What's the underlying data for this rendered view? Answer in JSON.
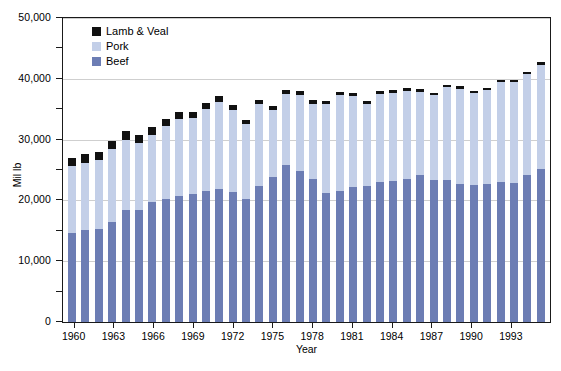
{
  "chart_data": {
    "type": "bar",
    "subtype": "stacked-bar",
    "title": "",
    "xlabel": "Year",
    "ylabel": "Mil lb",
    "ylim": [
      0,
      50000
    ],
    "ytick_labels": [
      "0",
      "10,000",
      "20,000",
      "30,000",
      "40,000",
      "50,000"
    ],
    "ytick_values": [
      0,
      10000,
      20000,
      30000,
      40000,
      50000
    ],
    "yminor_tick_values": [
      5000,
      15000,
      25000,
      35000,
      45000
    ],
    "grid": "horizontal-major",
    "legend_position": "top-left-inside",
    "categories": [
      "1960",
      "1961",
      "1962",
      "1963",
      "1964",
      "1965",
      "1966",
      "1967",
      "1968",
      "1969",
      "1970",
      "1971",
      "1972",
      "1973",
      "1974",
      "1975",
      "1976",
      "1977",
      "1978",
      "1979",
      "1980",
      "1981",
      "1982",
      "1983",
      "1984",
      "1985",
      "1986",
      "1987",
      "1988",
      "1989",
      "1990",
      "1991",
      "1992",
      "1993",
      "1994",
      "1995"
    ],
    "xtick_labels": [
      "1960",
      "1963",
      "1966",
      "1969",
      "1972",
      "1975",
      "1978",
      "1981",
      "1984",
      "1987",
      "1990",
      "1993"
    ],
    "series": [
      {
        "name": "Beef",
        "color": "#6c7db4",
        "values": [
          14700,
          15100,
          15300,
          16500,
          18400,
          18500,
          19700,
          20200,
          20800,
          21000,
          21600,
          21800,
          21400,
          20200,
          22400,
          23900,
          25800,
          24900,
          23500,
          21200,
          21600,
          22200,
          22300,
          23000,
          23200,
          23600,
          24100,
          23300,
          23400,
          22700,
          22500,
          22700,
          23000,
          22900,
          24100,
          25200
        ]
      },
      {
        "name": "Pork",
        "color": "#c3cfe8",
        "values": [
          10900,
          11100,
          11300,
          12000,
          11600,
          11000,
          11100,
          12100,
          12600,
          12600,
          13400,
          14400,
          13400,
          12400,
          13400,
          11000,
          11700,
          12500,
          12400,
          14600,
          15700,
          14900,
          13600,
          14500,
          14400,
          14400,
          13800,
          14000,
          15200,
          15700,
          15100,
          15400,
          16400,
          16500,
          16700,
          17100
        ]
      },
      {
        "name": "Lamb & Veal",
        "color": "#111111",
        "values": [
          1400,
          1400,
          1300,
          1300,
          1400,
          1300,
          1200,
          1100,
          1100,
          1000,
          950,
          900,
          850,
          700,
          700,
          700,
          700,
          600,
          550,
          500,
          500,
          500,
          500,
          500,
          500,
          500,
          450,
          430,
          420,
          400,
          400,
          400,
          400,
          400,
          400,
          400
        ]
      }
    ],
    "totals": [
      27000,
      27600,
      27900,
      29800,
      31400,
      30800,
      32000,
      33400,
      34500,
      34600,
      35950,
      37100,
      35650,
      33300,
      36500,
      35600,
      38200,
      38000,
      36450,
      36300,
      37800,
      37600,
      36400,
      38000,
      38100,
      38500,
      38350,
      37730,
      39020,
      38800,
      38000,
      38500,
      39800,
      39800,
      41200,
      42700
    ]
  },
  "legend": {
    "items": [
      {
        "label": "Lamb & Veal",
        "color": "#111111"
      },
      {
        "label": "Pork",
        "color": "#c3cfe8"
      },
      {
        "label": "Beef",
        "color": "#6c7db4"
      }
    ]
  },
  "axes": {
    "y_title": "Mil lb",
    "x_title": "Year"
  },
  "caption": {
    "text": ""
  }
}
